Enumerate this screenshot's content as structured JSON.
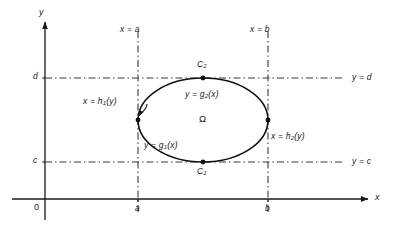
{
  "figure": {
    "kind": "math-diagram",
    "colors": {
      "ink": "#1a1a1a",
      "curve": "#111111",
      "dashed": "#3b3b3b",
      "background": "#ffffff"
    },
    "axes": {
      "x_axis_label": "x",
      "y_axis_label": "y",
      "origin_label": "0",
      "x_ticks": [
        {
          "label": "a",
          "x": 138
        },
        {
          "label": "b",
          "x": 268
        }
      ],
      "y_ticks": [
        {
          "label": "d",
          "y": 78
        },
        {
          "label": "c",
          "y": 162
        }
      ]
    },
    "guides": [
      {
        "name": "x-equals-a",
        "label": "x = a",
        "orientation": "vertical",
        "pos": 138
      },
      {
        "name": "x-equals-b",
        "label": "x = b",
        "orientation": "vertical",
        "pos": 268
      },
      {
        "name": "y-equals-d",
        "label": "y = d",
        "orientation": "horizontal",
        "pos": 78
      },
      {
        "name": "y-equals-c",
        "label": "y = c",
        "orientation": "horizontal",
        "pos": 162
      }
    ],
    "region_label": "Ω",
    "boundary_labels": {
      "upper_curve": {
        "text_pre": "y = g",
        "sub": "2",
        "text_post": "(x)"
      },
      "lower_curve": {
        "text_pre": "y = g",
        "sub": "1",
        "text_post": "(x)"
      },
      "left_curve": {
        "text_pre": "x = h",
        "sub": "1",
        "text_post": "(y)"
      },
      "right_curve": {
        "text_pre": "x = h",
        "sub": "2",
        "text_post": "(y)"
      }
    },
    "points": {
      "top": {
        "text_pre": "C",
        "sub": "2",
        "x": 203,
        "y": 78
      },
      "bottom": {
        "text_pre": "C",
        "sub": "1",
        "x": 203,
        "y": 162
      },
      "left": {
        "x": 138,
        "y": 120
      },
      "right": {
        "x": 268,
        "y": 120
      }
    },
    "ellipse": {
      "cx": 203,
      "cy": 120,
      "rx": 65,
      "ry": 42
    }
  }
}
